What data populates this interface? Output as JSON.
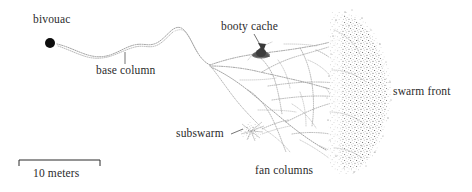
{
  "figure": {
    "type": "scientific-diagram",
    "background_color": "#ffffff",
    "ink_color": "#2b2b2b",
    "trail_color": "#8a8a8a"
  },
  "labels": {
    "bivouac": "bivouac",
    "base_column": "base column",
    "booty_cache": "booty cache",
    "swarm_front": "swarm front",
    "subswarm": "subswarm",
    "fan_columns": "fan columns"
  },
  "scale_bar": {
    "text": "10 meters",
    "length_px": 81,
    "value": 10,
    "unit": "meters"
  },
  "features": [
    {
      "name": "bivouac",
      "kind": "filled-circle",
      "x": 50,
      "y": 43,
      "r": 5
    },
    {
      "name": "booty-cache",
      "kind": "dark-cluster",
      "x": 261,
      "y": 53
    },
    {
      "name": "subswarm",
      "kind": "stipple-cluster",
      "x": 251,
      "y": 131
    },
    {
      "name": "swarm-front",
      "kind": "dense-stipple-arc",
      "x": 365,
      "y": 92
    }
  ]
}
